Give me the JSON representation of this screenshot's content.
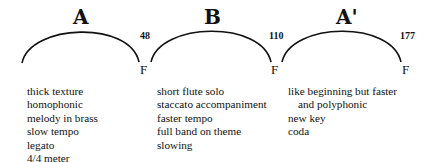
{
  "sections": [
    {
      "label": "A",
      "end_measure": "48",
      "cadence": "F",
      "features": [
        "thick texture",
        "homophonic",
        "melody in brass",
        "slow tempo",
        "legato",
        "4/4 meter"
      ]
    },
    {
      "label": "B",
      "end_measure": "110",
      "cadence": "F",
      "features": [
        "short flute solo",
        "staccato accompaniment",
        "faster tempo",
        "full band on theme",
        "slowing"
      ]
    },
    {
      "label": "A'",
      "end_measure": "177",
      "cadence": "F",
      "features": [
        "like beginning but faster",
        "and polyphonic",
        "new key",
        "coda"
      ]
    }
  ],
  "colors": {
    "ink": "#111111",
    "background": "#ffffff"
  }
}
